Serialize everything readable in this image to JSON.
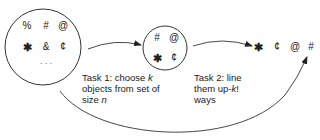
{
  "diagram": {
    "colors": {
      "stroke": "#333333",
      "text": "#222222",
      "background": "#ffffff"
    },
    "full_set": {
      "symbols": [
        "%",
        "#",
        "@",
        "✱",
        "&",
        "¢"
      ],
      "ellipsis": "· · ·"
    },
    "chosen_subset": {
      "symbols": [
        "#",
        "@",
        "✱",
        "¢"
      ]
    },
    "arrangement": {
      "symbols": [
        "✱",
        "¢",
        "@",
        "#"
      ]
    },
    "task1": {
      "line1_prefix": "Task 1:  choose ",
      "line1_var": "k",
      "line2": "objects from set of",
      "line3_prefix": "size ",
      "line3_var": "n"
    },
    "task2": {
      "line1": "Task 2:  line",
      "line2_prefix": "them up-",
      "line2_var": "k",
      "line2_suffix": "!",
      "line3": "ways"
    }
  }
}
